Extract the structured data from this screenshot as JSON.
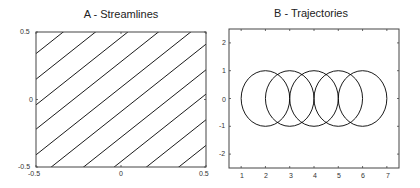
{
  "chart_data": [
    {
      "type": "line",
      "title": "A - Streamlines",
      "xlabel": "",
      "ylabel": "",
      "xlim": [
        -0.5,
        0.5
      ],
      "ylim": [
        -0.5,
        0.5
      ],
      "xticks": [
        "-0.5",
        "0",
        "0.5"
      ],
      "yticks": [
        "0.5",
        "0",
        "-0.5"
      ],
      "grid": false,
      "series_description": "Parallel straight streamlines y = x + c",
      "slope": 1,
      "intercepts": [
        -0.84,
        -0.65,
        -0.46,
        -0.28,
        -0.09,
        0.09,
        0.28,
        0.46,
        0.65,
        0.84
      ],
      "color": "#000000"
    },
    {
      "type": "line",
      "title": "B - Trajectories",
      "xlabel": "",
      "ylabel": "",
      "xlim": [
        0.5,
        7.5
      ],
      "ylim": [
        -2.5,
        2.5
      ],
      "xticks": [
        "1",
        "2",
        "3",
        "4",
        "5",
        "6",
        "7"
      ],
      "yticks": [
        "2",
        "1",
        "0",
        "-1",
        "-2"
      ],
      "grid": false,
      "series_description": "Circular trajectories of radius 1",
      "circles": [
        {
          "cx": 2,
          "cy": 0,
          "r": 1
        },
        {
          "cx": 3,
          "cy": 0,
          "r": 1
        },
        {
          "cx": 4,
          "cy": 0,
          "r": 1
        },
        {
          "cx": 5,
          "cy": 0,
          "r": 1
        },
        {
          "cx": 6,
          "cy": 0,
          "r": 1
        }
      ],
      "color": "#000000"
    }
  ],
  "panelA": {
    "title": "A - Streamlines",
    "xticks": [
      "-0.5",
      "0",
      "0.5"
    ],
    "yticks": [
      "0.5",
      "0",
      "-0.5"
    ]
  },
  "panelB": {
    "title": "B - Trajectories",
    "xticks": [
      "1",
      "2",
      "3",
      "4",
      "5",
      "6",
      "7"
    ],
    "yticks": [
      "2",
      "1",
      "0",
      "-1",
      "-2"
    ]
  }
}
